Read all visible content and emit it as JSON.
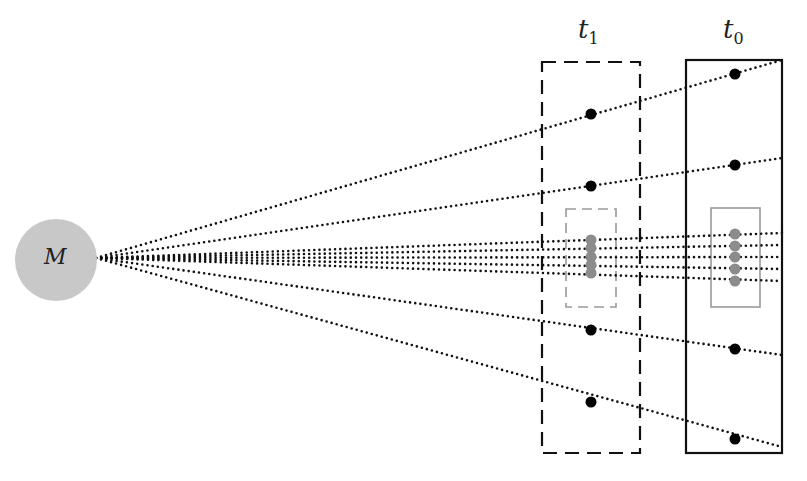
{
  "diagram": {
    "source": {
      "label": "M",
      "cx": 56,
      "cy": 260,
      "r": 41,
      "fill": "#c8c8c8"
    },
    "ray_origin": [
      96,
      258
    ],
    "frames": [
      {
        "id": "t1",
        "label": "t",
        "subscript": "1",
        "style": "dashed",
        "x": 542,
        "y": 62,
        "w": 98,
        "h": 391,
        "inner_box": {
          "x": 566,
          "y": 209,
          "w": 50,
          "h": 98,
          "style": "dashed",
          "color": "#999999"
        }
      },
      {
        "id": "t0",
        "label": "t",
        "subscript": "0",
        "style": "solid",
        "x": 686,
        "y": 60,
        "w": 96,
        "h": 393,
        "inner_box": {
          "x": 711,
          "y": 208,
          "w": 49,
          "h": 99,
          "style": "solid",
          "color": "#999999"
        }
      }
    ],
    "outer_rays": [
      {
        "end": [
          782,
          60
        ],
        "t1_point": [
          591,
          114
        ],
        "t0_point": [
          735,
          74
        ]
      },
      {
        "end": [
          782,
          158
        ],
        "t1_point": [
          591,
          186
        ],
        "t0_point": [
          735,
          165
        ]
      },
      {
        "end": [
          782,
          355
        ],
        "t1_point": [
          591,
          330
        ],
        "t0_point": [
          735,
          349
        ]
      },
      {
        "end": [
          782,
          447
        ],
        "t1_point": [
          591,
          402
        ],
        "t0_point": [
          735,
          439
        ]
      }
    ],
    "inner_rays": [
      {
        "end": [
          782,
          233
        ],
        "t1_point": [
          591,
          240
        ],
        "t0_point": [
          735,
          234
        ]
      },
      {
        "end": [
          782,
          245
        ],
        "t1_point": [
          591,
          248
        ],
        "t0_point": [
          735,
          246
        ]
      },
      {
        "end": [
          782,
          257
        ],
        "t1_point": [
          591,
          257
        ],
        "t0_point": [
          735,
          257
        ]
      },
      {
        "end": [
          782,
          269
        ],
        "t1_point": [
          591,
          265
        ],
        "t0_point": [
          735,
          269
        ]
      },
      {
        "end": [
          782,
          281
        ],
        "t1_point": [
          591,
          273
        ],
        "t0_point": [
          735,
          281
        ]
      }
    ],
    "colors": {
      "ray": "#111111",
      "outer_point": "#000000",
      "inner_point": "#8c8c8c",
      "frame": "#111111"
    }
  }
}
